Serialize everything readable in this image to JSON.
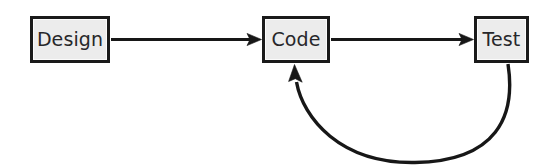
{
  "diagram": {
    "width": 555,
    "height": 166,
    "background_color": "#ffffff",
    "node_fill_color": "#ececec",
    "node_border_color": "#1a1a1a",
    "edge_color": "#171717",
    "label_color": "#27272a",
    "nodes": [
      {
        "id": "design",
        "label": "Design",
        "x": 30,
        "y": 16,
        "width": 80,
        "height": 47
      },
      {
        "id": "code",
        "label": "Code",
        "x": 262,
        "y": 16,
        "width": 68,
        "height": 47
      },
      {
        "id": "test",
        "label": "Test",
        "x": 474,
        "y": 16,
        "width": 55,
        "height": 47
      }
    ],
    "edges": [
      {
        "id": "design-to-code",
        "from": "design",
        "to": "code",
        "kind": "straight",
        "direction": "right",
        "arrowhead": "to"
      },
      {
        "id": "code-to-test",
        "from": "code",
        "to": "test",
        "kind": "straight",
        "direction": "right",
        "arrowhead": "to"
      },
      {
        "id": "test-to-code-feedback",
        "from": "test",
        "to": "code",
        "kind": "curved",
        "direction": "up",
        "arrowhead": "to"
      }
    ]
  }
}
